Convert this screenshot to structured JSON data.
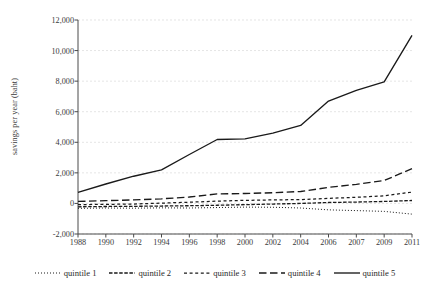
{
  "chart_data": {
    "type": "line",
    "title": "",
    "subtitle": "",
    "xlabel": "",
    "ylabel": "savings per year (baht)",
    "x": [
      1988,
      1990,
      1992,
      1994,
      1996,
      1998,
      2000,
      2002,
      2004,
      2006,
      2007,
      2009,
      2011
    ],
    "categories": [
      "1988",
      "1990",
      "1992",
      "1994",
      "1996",
      "1998",
      "2000",
      "2002",
      "2004",
      "2006",
      "2007",
      "2009",
      "2011"
    ],
    "xlim": [
      1988,
      2011
    ],
    "ylim": [
      -2000,
      12000
    ],
    "ytick_labels": [
      "12,000",
      "10,000",
      "8,000",
      "6,000",
      "4,000",
      "2,000",
      "0",
      "-2,000"
    ],
    "ytick_values": [
      12000,
      10000,
      8000,
      6000,
      4000,
      2000,
      0,
      -2000
    ],
    "grid": "horizontal",
    "legend_position": "bottom",
    "series": [
      {
        "name": "quintile 1",
        "dash": "dotted",
        "color": "#1a1a1a",
        "values": [
          -320,
          -300,
          -310,
          -290,
          -300,
          -270,
          -240,
          -250,
          -300,
          -420,
          -470,
          -520,
          -700
        ]
      },
      {
        "name": "quintile 2",
        "dash": "dense-dash",
        "color": "#1a1a1a",
        "values": [
          -220,
          -200,
          -190,
          -170,
          -150,
          -120,
          -80,
          -40,
          0,
          60,
          90,
          130,
          190
        ]
      },
      {
        "name": "quintile 3",
        "dash": "short-dash",
        "color": "#1a1a1a",
        "values": [
          -80,
          -60,
          -40,
          20,
          80,
          150,
          200,
          230,
          250,
          330,
          400,
          500,
          740
        ]
      },
      {
        "name": "quintile 4",
        "dash": "long-dash",
        "color": "#1a1a1a",
        "values": [
          130,
          180,
          230,
          300,
          420,
          620,
          650,
          700,
          780,
          1050,
          1250,
          1500,
          2270
        ]
      },
      {
        "name": "quintile 5",
        "dash": "solid",
        "color": "#1a1a1a",
        "values": [
          720,
          1270,
          1780,
          2200,
          3200,
          4180,
          4220,
          4600,
          5100,
          6700,
          7400,
          7950,
          11000
        ]
      }
    ]
  }
}
